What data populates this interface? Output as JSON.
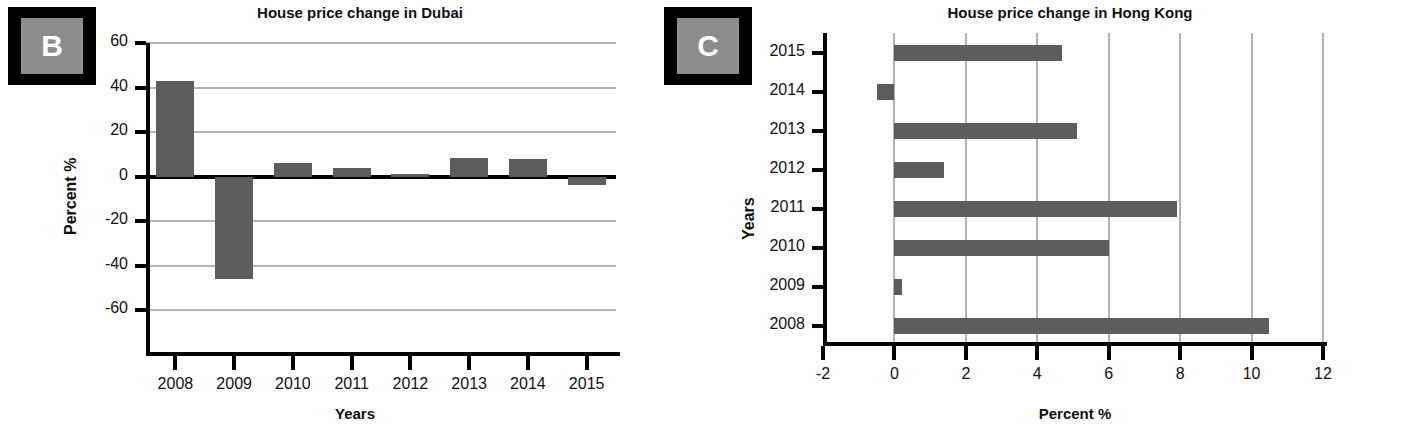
{
  "figure": {
    "panels": [
      {
        "id": "B",
        "badge_letter": "B",
        "title": "House price change in Dubai"
      },
      {
        "id": "C",
        "badge_letter": "C",
        "title": "House price change in Hong Kong"
      }
    ],
    "colors": {
      "bar": "#5c5c5c",
      "gridline": "#b3b3b3",
      "axis": "#000000",
      "badge_border": "#000000",
      "badge_fill": "#8c8c8c",
      "badge_letter": "#ffffff"
    }
  },
  "chart_data": [
    {
      "type": "bar",
      "title": "House price change in Dubai",
      "xlabel": "Years",
      "ylabel": "Percent %",
      "categories": [
        "2008",
        "2009",
        "2010",
        "2011",
        "2012",
        "2013",
        "2014",
        "2015"
      ],
      "values": [
        43,
        -46,
        6,
        4,
        1,
        8.5,
        8,
        -3.5
      ],
      "ylim": [
        -80,
        60
      ],
      "yticks": [
        60,
        40,
        20,
        0,
        -20,
        -40,
        -60
      ],
      "yticklabels": [
        "60",
        "40",
        "20",
        "0",
        "-20",
        "-40",
        "-60"
      ],
      "grid": true,
      "orientation": "vertical",
      "legend": null
    },
    {
      "type": "bar",
      "title": "House price change in Hong Kong",
      "xlabel": "Percent %",
      "ylabel": "Years",
      "categories": [
        "2015",
        "2014",
        "2013",
        "2012",
        "2011",
        "2010",
        "2009",
        "2008"
      ],
      "values": [
        4.7,
        -0.5,
        5.1,
        1.4,
        7.9,
        6.0,
        0.2,
        10.5
      ],
      "xlim": [
        -2,
        12
      ],
      "xticks": [
        -2,
        0,
        2,
        4,
        6,
        8,
        10,
        12
      ],
      "xticklabels": [
        "-2",
        "0",
        "2",
        "4",
        "6",
        "8",
        "10",
        "12"
      ],
      "grid": true,
      "orientation": "horizontal",
      "legend": null
    }
  ]
}
